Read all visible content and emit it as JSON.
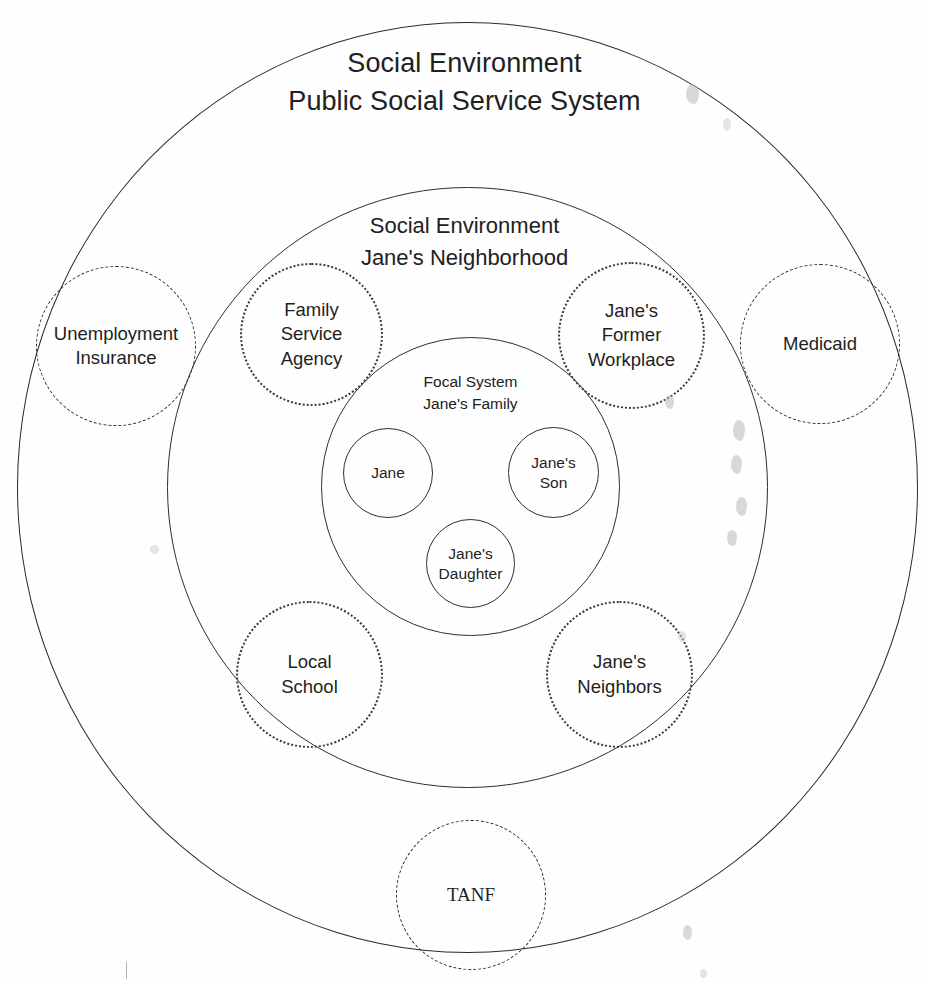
{
  "diagram": {
    "type": "nested-systems-ecomap",
    "background_color": "#fefefe",
    "line_color": "#2b2b2b"
  },
  "outer_system": {
    "name": "public-social-service-system",
    "label": "Social Environment\nPublic Social Service System",
    "line_style": "solid"
  },
  "middle_system": {
    "name": "janes-neighborhood",
    "label": "Social Environment\nJane's Neighborhood",
    "line_style": "solid"
  },
  "focal_system": {
    "name": "janes-family",
    "label": "Focal System\nJane's Family",
    "line_style": "solid",
    "members": [
      {
        "id": "jane",
        "label": "Jane"
      },
      {
        "id": "janes-son",
        "label": "Jane's\nSon"
      },
      {
        "id": "janes-daughter",
        "label": "Jane's\nDaughter"
      }
    ]
  },
  "neighborhood_nodes": [
    {
      "id": "family-service-agency",
      "label": "Family\nService\nAgency",
      "line_style": "dotted"
    },
    {
      "id": "janes-former-workplace",
      "label": "Jane's\nFormer\nWorkplace",
      "line_style": "dotted"
    },
    {
      "id": "local-school",
      "label": "Local\nSchool",
      "line_style": "dotted"
    },
    {
      "id": "janes-neighbors",
      "label": "Jane's\nNeighbors",
      "line_style": "dotted"
    }
  ],
  "service_nodes": [
    {
      "id": "unemployment-insurance",
      "label": "Unemployment\nInsurance",
      "line_style": "dashed"
    },
    {
      "id": "medicaid",
      "label": "Medicaid",
      "line_style": "dashed"
    },
    {
      "id": "tanf",
      "label": "TANF",
      "line_style": "dashed"
    }
  ]
}
